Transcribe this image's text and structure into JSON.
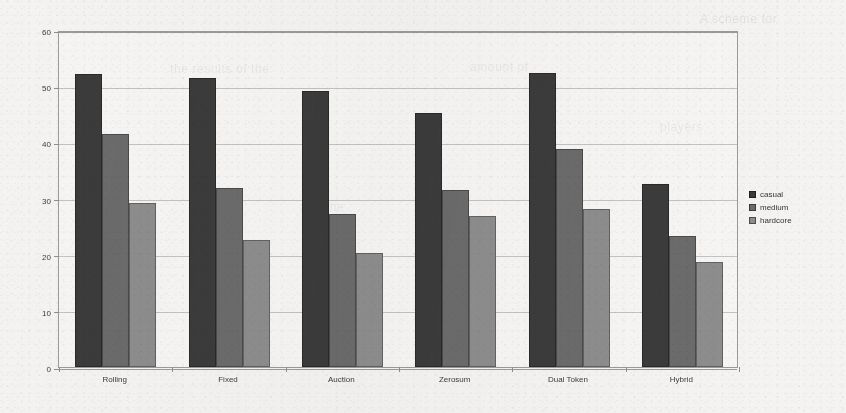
{
  "chart_data": {
    "type": "bar",
    "title": "",
    "subtitle": "",
    "xlabel": "",
    "ylabel": "",
    "categories": [
      "Rolling",
      "Fixed",
      "Auction",
      "Zerosum",
      "Dual Token",
      "Hybrid"
    ],
    "series": [
      {
        "name": "casual",
        "color": "#3b3b3b",
        "values": [
          52.2,
          51.5,
          49.2,
          45.3,
          52.4,
          32.5
        ]
      },
      {
        "name": "medium",
        "color": "#6b6b6b",
        "values": [
          41.5,
          31.8,
          27.3,
          31.6,
          38.8,
          23.4
        ]
      },
      {
        "name": "hardcore",
        "color": "#8d8d8d",
        "values": [
          29.2,
          22.7,
          20.3,
          26.9,
          28.1,
          18.7
        ]
      }
    ],
    "ylim": [
      0,
      60
    ],
    "yticks": [
      0,
      10,
      20,
      30,
      40,
      50,
      60
    ],
    "ytick_labels": [
      "0",
      "10",
      "20",
      "30",
      "40",
      "50",
      "60"
    ],
    "grid": true,
    "legend": {
      "position": "right",
      "entries": [
        "casual",
        "medium",
        "hardcore"
      ]
    }
  },
  "legend": {
    "items": [
      {
        "label": "casual",
        "swatch": "legend-swatch-casual"
      },
      {
        "label": "medium",
        "swatch": "legend-swatch-medium"
      },
      {
        "label": "hardcore",
        "swatch": "legend-swatch-hardcore"
      }
    ]
  },
  "bleed_text": [
    {
      "text": "the results of the",
      "x": 170,
      "y": 62
    },
    {
      "text": "amount of",
      "x": 470,
      "y": 60
    },
    {
      "text": "A scheme for",
      "x": 700,
      "y": 12
    },
    {
      "text": "players",
      "x": 660,
      "y": 120
    },
    {
      "text": "and the",
      "x": 300,
      "y": 200
    },
    {
      "text": "rewards",
      "x": 95,
      "y": 296
    }
  ]
}
